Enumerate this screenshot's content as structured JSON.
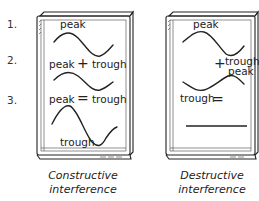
{
  "diagram": {
    "steps": [
      "1.",
      "2.",
      "3."
    ],
    "constructive": {
      "caption_line1": "Constructive",
      "caption_line2": "interference",
      "labels": {
        "peak_top": "peak",
        "row1_left": "peak",
        "row1_op": "+",
        "row1_right": "trough",
        "row2_left": "peak",
        "row2_op": "=",
        "row2_right": "trough",
        "bottom": "trough"
      }
    },
    "destructive": {
      "caption_line1": "Destructive",
      "caption_line2": "interference",
      "labels": {
        "peak_top": "peak",
        "row1_op": "+",
        "row1_right": "trough",
        "row1_right2": "peak",
        "row2_left": "trough",
        "row2_op": "="
      }
    }
  }
}
